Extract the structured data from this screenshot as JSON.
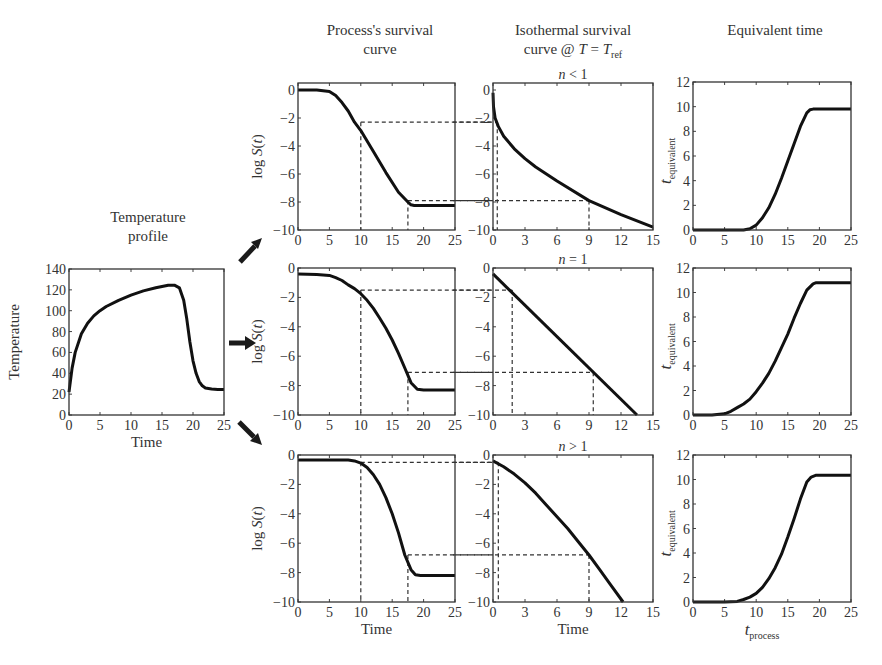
{
  "figure": {
    "column_titles": {
      "temperature": [
        "Temperature",
        "profile"
      ],
      "process": [
        "Process's survival",
        "curve"
      ],
      "isothermal": [
        "Isothermal survival",
        "curve @ T = T_ref"
      ],
      "equivalent": [
        "Equivalent time"
      ]
    },
    "arrows": [
      "arrow-up-right",
      "arrow-right",
      "arrow-down-right"
    ]
  },
  "chart_data": [
    {
      "id": "temperature",
      "type": "line",
      "title": "Temperature profile",
      "xlabel": "Time",
      "ylabel": "Temperature",
      "xlim": [
        0,
        25
      ],
      "ylim": [
        0,
        140
      ],
      "xticks": [
        0,
        5,
        10,
        15,
        20,
        25
      ],
      "yticks": [
        0,
        20,
        40,
        60,
        80,
        100,
        120,
        140
      ],
      "box": [
        69,
        269,
        224,
        415
      ],
      "x": [
        0,
        0.5,
        1,
        2,
        3,
        4,
        5,
        6,
        8,
        10,
        12,
        14,
        16,
        17,
        17.8,
        18.5,
        19,
        19.5,
        20,
        20.5,
        21,
        21.5,
        22,
        23,
        24,
        25
      ],
      "y": [
        22,
        45,
        60,
        78,
        88,
        95,
        100,
        104,
        110,
        115,
        119,
        122,
        124.5,
        124.5,
        122,
        110,
        92,
        70,
        52,
        40,
        32,
        28,
        26,
        25,
        24.5,
        24.5
      ]
    },
    {
      "id": "process_n_lt_1",
      "type": "line",
      "row": 1,
      "title": "Process's survival curve",
      "ylabel": "log S(t)",
      "xlim": [
        0,
        25
      ],
      "ylim": [
        -10,
        0.5
      ],
      "xticks": [
        0,
        5,
        10,
        15,
        20,
        25
      ],
      "yticks": [
        0,
        -2,
        -4,
        -6,
        -8,
        -10
      ],
      "box": [
        298,
        83,
        455,
        230
      ],
      "x": [
        0,
        3,
        5,
        6,
        7,
        8,
        9,
        10,
        12,
        14,
        16,
        17.5,
        18,
        18.5,
        19,
        25
      ],
      "y": [
        0,
        0,
        -0.1,
        -0.4,
        -0.9,
        -1.5,
        -2.3,
        -2.9,
        -4.4,
        -5.9,
        -7.3,
        -8.0,
        -8.2,
        -8.25,
        -8.25,
        -8.25
      ],
      "guides": [
        {
          "x": 10,
          "y": -2.3
        },
        {
          "x": 17.5,
          "y": -7.9
        }
      ]
    },
    {
      "id": "isothermal_n_lt_1",
      "type": "line",
      "row": 1,
      "title": "Isothermal survival curve @ T = T_ref",
      "subtitle": "n < 1",
      "xlim": [
        0,
        15
      ],
      "ylim": [
        -10,
        0.5
      ],
      "xticks": [
        0,
        3,
        6,
        9,
        12,
        15
      ],
      "yticks": [
        0,
        -2,
        -4,
        -6,
        -8,
        -10
      ],
      "box": [
        493,
        83,
        653,
        230
      ],
      "x": [
        0,
        0.05,
        0.2,
        0.5,
        1,
        2,
        3,
        4,
        6,
        9,
        12,
        15
      ],
      "y": [
        -0.2,
        -1.2,
        -2.0,
        -2.6,
        -3.3,
        -4.2,
        -4.9,
        -5.5,
        -6.5,
        -7.9,
        -8.9,
        -9.8
      ],
      "guides": [
        {
          "x": 0.4,
          "y": -2.3
        },
        {
          "x": 9,
          "y": -7.9
        }
      ]
    },
    {
      "id": "equivalent_n_lt_1",
      "type": "line",
      "row": 1,
      "title": "Equivalent time",
      "ylabel": "t_equivalent",
      "xlim": [
        0,
        25
      ],
      "ylim": [
        0,
        12
      ],
      "xticks": [
        0,
        5,
        10,
        15,
        20,
        25
      ],
      "yticks": [
        0,
        2,
        4,
        6,
        8,
        10,
        12
      ],
      "box": [
        693,
        82,
        851,
        230
      ],
      "x": [
        0,
        8,
        9,
        10,
        11,
        12,
        13,
        14,
        15,
        16,
        17,
        18,
        18.5,
        19,
        25
      ],
      "y": [
        0,
        0,
        0.1,
        0.4,
        1.0,
        1.8,
        2.9,
        4.2,
        5.6,
        7.0,
        8.4,
        9.5,
        9.75,
        9.8,
        9.8
      ]
    },
    {
      "id": "process_n_eq_1",
      "type": "line",
      "row": 2,
      "ylabel": "log S(t)",
      "xlim": [
        0,
        25
      ],
      "ylim": [
        -10,
        0
      ],
      "xticks": [
        0,
        5,
        10,
        15,
        20,
        25
      ],
      "yticks": [
        0,
        -2,
        -4,
        -6,
        -8,
        -10
      ],
      "box": [
        298,
        268,
        455,
        415
      ],
      "x": [
        0,
        3,
        5,
        6,
        7,
        8,
        9,
        10,
        11,
        12,
        13,
        14,
        15,
        16,
        17,
        18,
        19,
        20,
        25
      ],
      "y": [
        -0.4,
        -0.45,
        -0.5,
        -0.65,
        -0.85,
        -1.15,
        -1.4,
        -1.75,
        -2.2,
        -2.75,
        -3.4,
        -4.1,
        -4.9,
        -5.8,
        -6.8,
        -7.8,
        -8.25,
        -8.3,
        -8.3
      ],
      "guides": [
        {
          "x": 10,
          "y": -1.5
        },
        {
          "x": 17.5,
          "y": -7.1
        }
      ]
    },
    {
      "id": "isothermal_n_eq_1",
      "type": "line",
      "row": 2,
      "subtitle": "n = 1",
      "xlim": [
        0,
        15
      ],
      "ylim": [
        -10,
        0
      ],
      "xticks": [
        0,
        3,
        6,
        9,
        12,
        15
      ],
      "yticks": [
        0,
        -2,
        -4,
        -6,
        -8,
        -10
      ],
      "box": [
        493,
        268,
        653,
        415
      ],
      "x": [
        0,
        13.5
      ],
      "y": [
        -0.4,
        -10
      ],
      "guides": [
        {
          "x": 1.8,
          "y": -1.5
        },
        {
          "x": 9.4,
          "y": -7.1
        }
      ]
    },
    {
      "id": "equivalent_n_eq_1",
      "type": "line",
      "row": 2,
      "ylabel": "t_equivalent",
      "xlim": [
        0,
        25
      ],
      "ylim": [
        0,
        12
      ],
      "xticks": [
        0,
        5,
        10,
        15,
        20,
        25
      ],
      "yticks": [
        0,
        2,
        4,
        6,
        8,
        10,
        12
      ],
      "box": [
        693,
        268,
        851,
        415
      ],
      "x": [
        0,
        3,
        5,
        6,
        7,
        8,
        9,
        10,
        11,
        12,
        13,
        14,
        15,
        16,
        17,
        18,
        19,
        19.5,
        25
      ],
      "y": [
        0,
        0,
        0.1,
        0.3,
        0.6,
        0.9,
        1.3,
        1.9,
        2.6,
        3.4,
        4.4,
        5.5,
        6.6,
        7.9,
        9.1,
        10.2,
        10.7,
        10.8,
        10.8
      ]
    },
    {
      "id": "process_n_gt_1",
      "type": "line",
      "row": 3,
      "xlabel": "Time",
      "ylabel": "log S(t)",
      "xlim": [
        0,
        25
      ],
      "ylim": [
        -10,
        0
      ],
      "xticks": [
        0,
        5,
        10,
        15,
        20,
        25
      ],
      "yticks": [
        0,
        -2,
        -4,
        -6,
        -8,
        -10
      ],
      "box": [
        298,
        455,
        455,
        602
      ],
      "x": [
        0,
        5,
        8,
        9,
        10,
        11,
        12,
        13,
        14,
        15,
        16,
        17,
        18,
        18.7,
        19.5,
        25
      ],
      "y": [
        -0.35,
        -0.35,
        -0.35,
        -0.4,
        -0.55,
        -0.85,
        -1.35,
        -2.0,
        -2.9,
        -4.0,
        -5.3,
        -6.8,
        -7.8,
        -8.15,
        -8.2,
        -8.2
      ],
      "guides": [
        {
          "x": 10,
          "y": -0.5
        },
        {
          "x": 17.5,
          "y": -6.8
        }
      ]
    },
    {
      "id": "isothermal_n_gt_1",
      "type": "line",
      "row": 3,
      "subtitle": "n > 1",
      "xlabel": "Time",
      "xlim": [
        0,
        15
      ],
      "ylim": [
        -10,
        0
      ],
      "xticks": [
        0,
        3,
        6,
        9,
        12,
        15
      ],
      "yticks": [
        0,
        -2,
        -4,
        -6,
        -8,
        -10
      ],
      "box": [
        493,
        455,
        653,
        602
      ],
      "x": [
        0,
        1,
        2,
        3,
        4,
        5,
        6,
        7,
        8,
        9,
        10,
        11,
        12.2
      ],
      "y": [
        -0.4,
        -0.8,
        -1.3,
        -1.9,
        -2.6,
        -3.4,
        -4.2,
        -5.0,
        -5.9,
        -6.8,
        -7.8,
        -8.8,
        -10
      ],
      "guides": [
        {
          "x": 0.5,
          "y": -0.5
        },
        {
          "x": 9,
          "y": -6.8
        }
      ]
    },
    {
      "id": "equivalent_n_gt_1",
      "type": "line",
      "row": 3,
      "xlabel": "t_process",
      "ylabel": "t_equivalent",
      "xlim": [
        0,
        25
      ],
      "ylim": [
        0,
        12
      ],
      "xticks": [
        0,
        5,
        10,
        15,
        20,
        25
      ],
      "yticks": [
        0,
        2,
        4,
        6,
        8,
        10,
        12
      ],
      "box": [
        693,
        455,
        851,
        602
      ],
      "x": [
        0,
        5,
        7,
        8,
        9,
        10,
        11,
        12,
        13,
        14,
        15,
        16,
        17,
        18,
        18.7,
        19.5,
        25
      ],
      "y": [
        0,
        0,
        0.05,
        0.2,
        0.4,
        0.7,
        1.2,
        1.9,
        2.8,
        3.9,
        5.3,
        6.8,
        8.4,
        9.8,
        10.2,
        10.35,
        10.35
      ]
    }
  ]
}
